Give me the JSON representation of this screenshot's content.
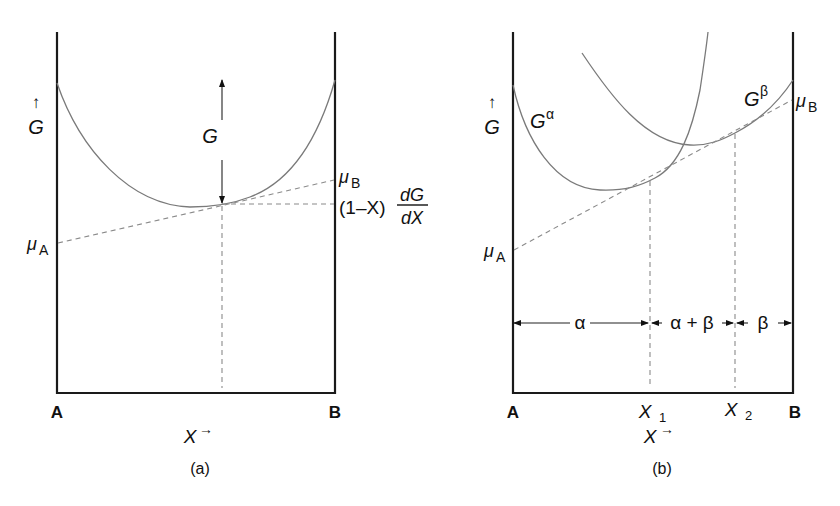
{
  "panel_a": {
    "caption": "(a)",
    "y_axis_label": "G",
    "y_axis_arrow": "↑",
    "x_axis_label": "X",
    "x_axis_arrow": "→",
    "left_endpoint": "A",
    "right_endpoint": "B",
    "curve_label": "G",
    "mu_a_symbol": "μ",
    "mu_a_sub": "A",
    "mu_b_symbol": "μ",
    "mu_b_sub": "B",
    "tangent_expr_prefix": "(1–X)",
    "tangent_expr_num": "dG",
    "tangent_expr_den": "dX"
  },
  "panel_b": {
    "caption": "(b)",
    "y_axis_label": "G",
    "y_axis_arrow": "↑",
    "x_axis_label": "X",
    "x_axis_arrow": "→",
    "left_endpoint": "A",
    "right_endpoint": "B",
    "x1_label": "X",
    "x1_sub": "1",
    "x2_label": "X",
    "x2_sub": "2",
    "g_alpha": "G",
    "g_alpha_sup": "α",
    "g_beta": "G",
    "g_beta_sup": "β",
    "mu_a_symbol": "μ",
    "mu_a_sub": "A",
    "mu_b_symbol": "μ",
    "mu_b_sub": "B",
    "regions": [
      "α",
      "α + β",
      "β"
    ]
  }
}
